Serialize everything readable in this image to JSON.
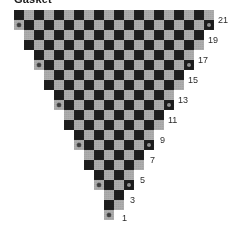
{
  "title": "Gasket",
  "figure": {
    "type": "triangular-checkerboard",
    "grid": {
      "cell_size": 10,
      "origin_x": 14,
      "origin_y": 10,
      "rows": 21,
      "top_row_cells": 20,
      "bottom_row_cells": 1
    },
    "colors": {
      "dark_cell": "#1c1c1c",
      "light_cell": "#a8a8a8",
      "marker": "#3a3a3a",
      "marker_on_dark": "#8f8f8f",
      "background": "#ffffff",
      "label_text": "#2b2b2b",
      "title_text": "#1a1a1a"
    },
    "row_widths": [
      20,
      20,
      18,
      18,
      16,
      16,
      14,
      14,
      12,
      12,
      10,
      10,
      8,
      8,
      6,
      6,
      4,
      4,
      2,
      2,
      1
    ],
    "row_insets": [
      0,
      0,
      1,
      1,
      2,
      2,
      3,
      3,
      4,
      4,
      5,
      5,
      6,
      6,
      7,
      7,
      8,
      8,
      9,
      9,
      9
    ],
    "labels": [
      {
        "text": "21",
        "row": 1,
        "x": 218,
        "y": 16
      },
      {
        "text": "19",
        "row": 3,
        "x": 208,
        "y": 36
      },
      {
        "text": "17",
        "row": 5,
        "x": 198,
        "y": 56
      },
      {
        "text": "15",
        "row": 7,
        "x": 188,
        "y": 76
      },
      {
        "text": "13",
        "row": 9,
        "x": 178,
        "y": 96
      },
      {
        "text": "11",
        "row": 11,
        "x": 168,
        "y": 116
      },
      {
        "text": "9",
        "row": 13,
        "x": 160,
        "y": 136
      },
      {
        "text": "7",
        "row": 15,
        "x": 150,
        "y": 156
      },
      {
        "text": "5",
        "row": 17,
        "x": 140,
        "y": 176
      },
      {
        "text": "3",
        "row": 19,
        "x": 130,
        "y": 196
      },
      {
        "text": "1",
        "row": 21,
        "x": 122,
        "y": 214
      }
    ],
    "marker_rows": [
      2,
      6,
      10,
      14,
      18,
      21
    ],
    "marker_note": "Small round dots appear on the outermost cell at each end of selected rows."
  }
}
